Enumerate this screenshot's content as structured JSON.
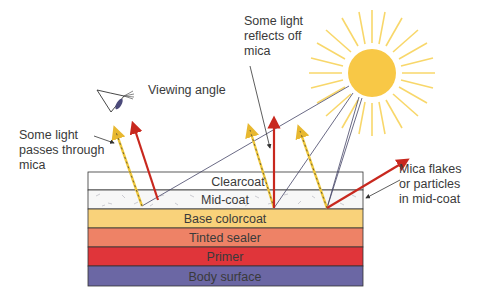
{
  "diagram": {
    "type": "layered cross-section",
    "layers": [
      {
        "label": "Clearcoat",
        "color": "#ffffff"
      },
      {
        "label": "Mid-coat",
        "color": "#f7f7f7"
      },
      {
        "label": "Base colorcoat",
        "color": "#f9d27a"
      },
      {
        "label": "Tinted sealer",
        "color": "#ee8266"
      },
      {
        "label": "Primer",
        "color": "#e0353a"
      },
      {
        "label": "Body surface",
        "color": "#6b67a4"
      }
    ],
    "annotations": {
      "viewing_angle": "Viewing angle",
      "passes_through": "Some light\npasses through\nmica",
      "reflects_off": "Some light\nreflects off\nmica",
      "mica_flakes": "Mica flakes\nor particles\nin mid-coat"
    },
    "icons": {
      "sun": "sun-icon",
      "eye": "eye-icon"
    },
    "colors": {
      "sun": "#f8c846",
      "ray_line": "#444466",
      "reflected_arrow": "#c8281e",
      "passing_arrow": "#f0c83c",
      "outline": "#333333"
    }
  }
}
